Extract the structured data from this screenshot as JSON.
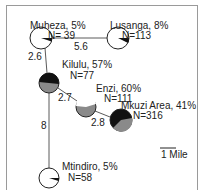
{
  "map": {
    "colors": {
      "frame": "#9a9a9a",
      "edge": "#5a5a5a",
      "pie_positive": "#111111",
      "pie_negative": "#8a8a8a",
      "pie_empty": "#ffffff"
    },
    "sites": [
      {
        "id": "muheza",
        "name": "Muheza, 5%",
        "n_label": "N= 39",
        "percent": 5,
        "n": 39,
        "cx": 41,
        "cy": 38,
        "r": 11
      },
      {
        "id": "lusanga",
        "name": "Lusanga, 8%",
        "n_label": "N=113",
        "percent": 8,
        "n": 113,
        "cx": 118,
        "cy": 38,
        "r": 11
      },
      {
        "id": "kilulu",
        "name": "Kilulu, 57%",
        "n_label": "N=77",
        "percent": 57,
        "n": 77,
        "cx": 49,
        "cy": 83,
        "r": 10
      },
      {
        "id": "enzi",
        "name": "Enzi, 60%",
        "n_label": "N=111",
        "percent": 60,
        "n": 111,
        "cx": 86,
        "cy": 107,
        "r": 10
      },
      {
        "id": "mkuzi",
        "name": "Mkuzi Area, 41%",
        "n_label": "N=316",
        "percent": 41,
        "n": 316,
        "cx": 121,
        "cy": 120,
        "r": 11
      },
      {
        "id": "mtindiro",
        "name": "Mtindiro, 5%",
        "n_label": "N=58",
        "percent": 5,
        "n": 58,
        "cx": 49,
        "cy": 178,
        "r": 10
      }
    ],
    "edges": [
      {
        "from": "muheza",
        "to": "lusanga",
        "distance": "5.6"
      },
      {
        "from": "muheza",
        "to": "kilulu",
        "distance": "2.6"
      },
      {
        "from": "kilulu",
        "to": "enzi",
        "distance": "2.7"
      },
      {
        "from": "enzi",
        "to": "mkuzi",
        "distance": "2.8"
      },
      {
        "from": "kilulu",
        "to": "mtindiro",
        "distance": "8"
      }
    ],
    "scale_bar": {
      "label": "1 Mile"
    }
  }
}
